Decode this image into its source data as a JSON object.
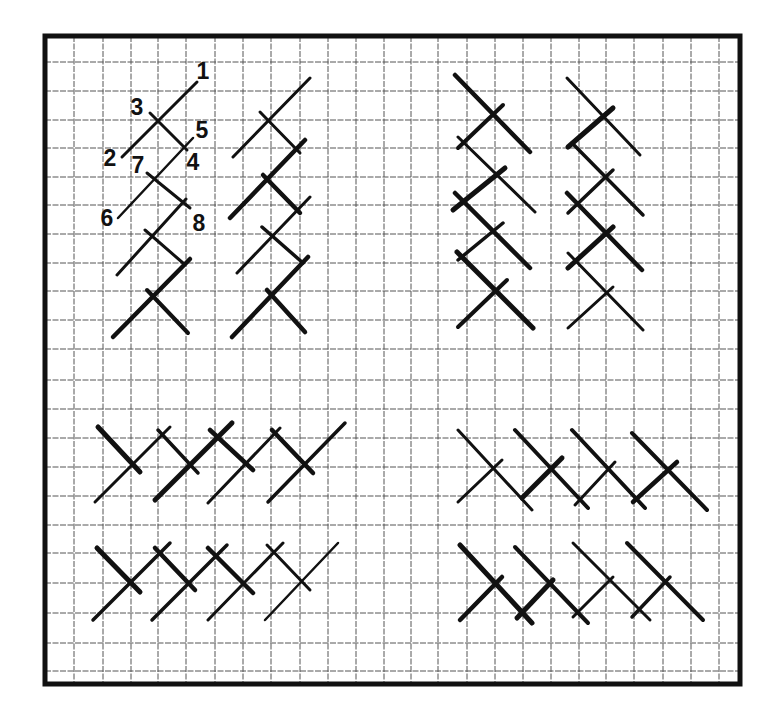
{
  "diagram": {
    "title": "Herringbone stitch grid diagram",
    "colors": {
      "background": "#ffffff",
      "border": "#111111",
      "grid": "#555555",
      "stitch": "#111111"
    },
    "frame": {
      "x": 45,
      "y": 36,
      "width": 695,
      "height": 648,
      "stroke": 5
    },
    "grid": {
      "x_lines": [
        74,
        103,
        131,
        158,
        186,
        215,
        243,
        271,
        300,
        328,
        356,
        384,
        411,
        438,
        467,
        495,
        523,
        551,
        579,
        606,
        634,
        663,
        691,
        719
      ],
      "y_lines": [
        62,
        91,
        120,
        148,
        177,
        205,
        234,
        263,
        291,
        320,
        349,
        380,
        409,
        438,
        467,
        496,
        525,
        553,
        583,
        613,
        643,
        671
      ]
    },
    "labels": [
      {
        "text": "1",
        "x": 203,
        "y": 79
      },
      {
        "text": "3",
        "x": 137,
        "y": 115
      },
      {
        "text": "5",
        "x": 202,
        "y": 138
      },
      {
        "text": "2",
        "x": 110,
        "y": 166
      },
      {
        "text": "7",
        "x": 138,
        "y": 173
      },
      {
        "text": "4",
        "x": 193,
        "y": 170
      },
      {
        "text": "6",
        "x": 107,
        "y": 226
      },
      {
        "text": "8",
        "x": 199,
        "y": 231
      }
    ],
    "groups": [
      {
        "name": "top-left-vertical-numbered",
        "stitches": [
          {
            "x1": 197,
            "y1": 82,
            "x2": 122,
            "y2": 157,
            "w": 3
          },
          {
            "x1": 150,
            "y1": 113,
            "x2": 187,
            "y2": 150,
            "w": 3
          },
          {
            "x1": 193,
            "y1": 138,
            "x2": 118,
            "y2": 218,
            "w": 2.5
          },
          {
            "x1": 147,
            "y1": 173,
            "x2": 190,
            "y2": 208,
            "w": 3
          },
          {
            "x1": 186,
            "y1": 199,
            "x2": 117,
            "y2": 275,
            "w": 3
          },
          {
            "x1": 145,
            "y1": 230,
            "x2": 183,
            "y2": 263,
            "w": 3
          },
          {
            "x1": 190,
            "y1": 259,
            "x2": 113,
            "y2": 337,
            "w": 4.5
          },
          {
            "x1": 147,
            "y1": 290,
            "x2": 188,
            "y2": 333,
            "w": 4
          }
        ]
      },
      {
        "name": "top-left-vertical-second",
        "stitches": [
          {
            "x1": 310,
            "y1": 78,
            "x2": 233,
            "y2": 157,
            "w": 3
          },
          {
            "x1": 260,
            "y1": 112,
            "x2": 300,
            "y2": 153,
            "w": 3
          },
          {
            "x1": 305,
            "y1": 140,
            "x2": 230,
            "y2": 218,
            "w": 4.5
          },
          {
            "x1": 263,
            "y1": 175,
            "x2": 300,
            "y2": 213,
            "w": 4.5
          },
          {
            "x1": 310,
            "y1": 197,
            "x2": 237,
            "y2": 273,
            "w": 3
          },
          {
            "x1": 262,
            "y1": 227,
            "x2": 303,
            "y2": 263,
            "w": 3.5
          },
          {
            "x1": 308,
            "y1": 257,
            "x2": 232,
            "y2": 337,
            "w": 4.5
          },
          {
            "x1": 267,
            "y1": 290,
            "x2": 305,
            "y2": 332,
            "w": 4.5
          }
        ]
      },
      {
        "name": "top-right-vertical-first",
        "stitches": [
          {
            "x1": 455,
            "y1": 75,
            "x2": 530,
            "y2": 152,
            "w": 4.5
          },
          {
            "x1": 503,
            "y1": 105,
            "x2": 458,
            "y2": 148,
            "w": 4
          },
          {
            "x1": 458,
            "y1": 137,
            "x2": 535,
            "y2": 212,
            "w": 3
          },
          {
            "x1": 505,
            "y1": 168,
            "x2": 453,
            "y2": 210,
            "w": 5
          },
          {
            "x1": 455,
            "y1": 193,
            "x2": 530,
            "y2": 268,
            "w": 4.5
          },
          {
            "x1": 503,
            "y1": 223,
            "x2": 458,
            "y2": 260,
            "w": 3.5
          },
          {
            "x1": 457,
            "y1": 252,
            "x2": 533,
            "y2": 328,
            "w": 5
          },
          {
            "x1": 507,
            "y1": 280,
            "x2": 458,
            "y2": 327,
            "w": 4
          }
        ]
      },
      {
        "name": "top-right-vertical-second",
        "stitches": [
          {
            "x1": 567,
            "y1": 78,
            "x2": 640,
            "y2": 155,
            "w": 3
          },
          {
            "x1": 613,
            "y1": 108,
            "x2": 568,
            "y2": 147,
            "w": 5
          },
          {
            "x1": 572,
            "y1": 143,
            "x2": 643,
            "y2": 215,
            "w": 3.5
          },
          {
            "x1": 613,
            "y1": 170,
            "x2": 568,
            "y2": 213,
            "w": 3.5
          },
          {
            "x1": 567,
            "y1": 193,
            "x2": 642,
            "y2": 270,
            "w": 4.5
          },
          {
            "x1": 613,
            "y1": 227,
            "x2": 568,
            "y2": 268,
            "w": 5
          },
          {
            "x1": 568,
            "y1": 253,
            "x2": 643,
            "y2": 330,
            "w": 3
          },
          {
            "x1": 613,
            "y1": 287,
            "x2": 568,
            "y2": 328,
            "w": 3
          }
        ]
      },
      {
        "name": "bottom-left-horizontal-first",
        "stitches": [
          {
            "x1": 98,
            "y1": 427,
            "x2": 140,
            "y2": 472,
            "w": 5
          },
          {
            "x1": 95,
            "y1": 502,
            "x2": 170,
            "y2": 427,
            "w": 3
          },
          {
            "x1": 158,
            "y1": 430,
            "x2": 198,
            "y2": 473,
            "w": 3.5
          },
          {
            "x1": 155,
            "y1": 500,
            "x2": 232,
            "y2": 423,
            "w": 5
          },
          {
            "x1": 210,
            "y1": 430,
            "x2": 253,
            "y2": 470,
            "w": 4.5
          },
          {
            "x1": 208,
            "y1": 503,
            "x2": 280,
            "y2": 428,
            "w": 3
          },
          {
            "x1": 272,
            "y1": 430,
            "x2": 313,
            "y2": 473,
            "w": 4.5
          },
          {
            "x1": 268,
            "y1": 502,
            "x2": 345,
            "y2": 423,
            "w": 3.5
          }
        ]
      },
      {
        "name": "bottom-left-horizontal-second",
        "stitches": [
          {
            "x1": 97,
            "y1": 548,
            "x2": 140,
            "y2": 592,
            "w": 5
          },
          {
            "x1": 93,
            "y1": 620,
            "x2": 170,
            "y2": 543,
            "w": 3.5
          },
          {
            "x1": 155,
            "y1": 548,
            "x2": 195,
            "y2": 590,
            "w": 4.5
          },
          {
            "x1": 152,
            "y1": 620,
            "x2": 227,
            "y2": 545,
            "w": 3.5
          },
          {
            "x1": 208,
            "y1": 548,
            "x2": 253,
            "y2": 593,
            "w": 4.5
          },
          {
            "x1": 208,
            "y1": 620,
            "x2": 283,
            "y2": 543,
            "w": 3
          },
          {
            "x1": 267,
            "y1": 545,
            "x2": 310,
            "y2": 590,
            "w": 3
          },
          {
            "x1": 265,
            "y1": 620,
            "x2": 338,
            "y2": 543,
            "w": 2.5
          }
        ]
      },
      {
        "name": "bottom-right-horizontal-first",
        "stitches": [
          {
            "x1": 458,
            "y1": 430,
            "x2": 532,
            "y2": 510,
            "w": 3
          },
          {
            "x1": 458,
            "y1": 502,
            "x2": 502,
            "y2": 460,
            "w": 3
          },
          {
            "x1": 515,
            "y1": 430,
            "x2": 588,
            "y2": 508,
            "w": 4
          },
          {
            "x1": 522,
            "y1": 498,
            "x2": 562,
            "y2": 458,
            "w": 5
          },
          {
            "x1": 572,
            "y1": 430,
            "x2": 645,
            "y2": 508,
            "w": 4
          },
          {
            "x1": 575,
            "y1": 505,
            "x2": 615,
            "y2": 462,
            "w": 3
          },
          {
            "x1": 632,
            "y1": 433,
            "x2": 707,
            "y2": 510,
            "w": 4
          },
          {
            "x1": 633,
            "y1": 502,
            "x2": 677,
            "y2": 462,
            "w": 4.5
          }
        ]
      },
      {
        "name": "bottom-right-horizontal-second",
        "stitches": [
          {
            "x1": 460,
            "y1": 545,
            "x2": 532,
            "y2": 623,
            "w": 5
          },
          {
            "x1": 460,
            "y1": 620,
            "x2": 502,
            "y2": 577,
            "w": 4.5
          },
          {
            "x1": 515,
            "y1": 547,
            "x2": 588,
            "y2": 623,
            "w": 4
          },
          {
            "x1": 517,
            "y1": 618,
            "x2": 553,
            "y2": 580,
            "w": 5
          },
          {
            "x1": 573,
            "y1": 543,
            "x2": 590,
            "y2": 623,
            "w": 0
          },
          {
            "x1": 573,
            "y1": 543,
            "x2": 650,
            "y2": 620,
            "w": 3
          },
          {
            "x1": 573,
            "y1": 617,
            "x2": 613,
            "y2": 577,
            "w": 3
          },
          {
            "x1": 627,
            "y1": 543,
            "x2": 703,
            "y2": 620,
            "w": 4
          },
          {
            "x1": 632,
            "y1": 617,
            "x2": 670,
            "y2": 577,
            "w": 3.5
          }
        ]
      }
    ]
  }
}
